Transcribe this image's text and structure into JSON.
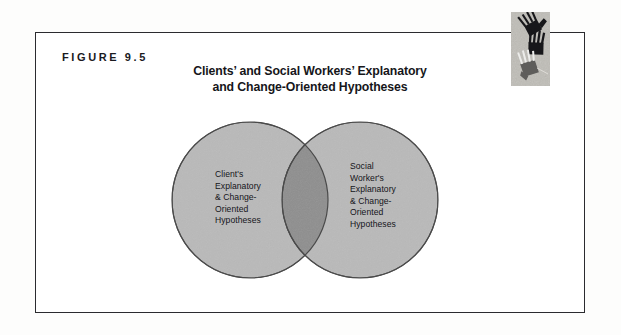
{
  "figure": {
    "label": "FIGURE 9.5",
    "title_line1": "Clients’ and Social Workers’ Explanatory",
    "title_line2": "and Change-Oriented Hypotheses"
  },
  "diagram": {
    "type": "venn",
    "left_circle": {
      "name": "client-hypotheses-circle",
      "lines": [
        "Client's",
        "Explanatory",
        "& Change-",
        "Oriented",
        "Hypotheses"
      ]
    },
    "right_circle": {
      "name": "social-worker-hypotheses-circle",
      "lines": [
        "Social",
        "Worker's",
        "Explanatory",
        "& Change-",
        "Oriented",
        "Hypotheses"
      ]
    },
    "overlap": {
      "name": "shared-hypotheses-overlap",
      "label": ""
    }
  },
  "decoration": {
    "image_name": "striped-hands-illustration"
  },
  "colors": {
    "circle_fill": "#b9b9b9",
    "overlap_fill": "#8e8e8e",
    "circle_stroke": "#4a4a4a",
    "border": "#2b2b2f",
    "text": "#16161a",
    "page_background": "#fdfdfc"
  }
}
